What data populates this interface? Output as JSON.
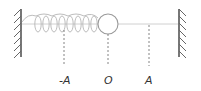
{
  "diagram": {
    "labels": {
      "neg_amplitude": "-A",
      "origin": "O",
      "pos_amplitude": "A"
    },
    "colors": {
      "wall": "#555555",
      "spring": "#b0b0b0",
      "rod": "#c8c8c8",
      "mass": "#9a9a9a",
      "dash": "#777777",
      "text": "#333333"
    }
  }
}
